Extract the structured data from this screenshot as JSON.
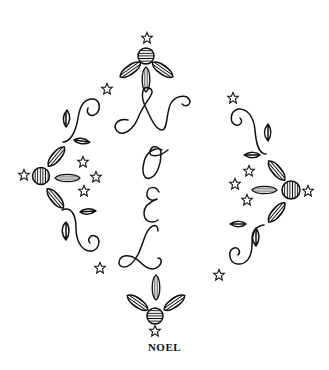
{
  "artwork": {
    "subject": "Embroidery pattern: the word NOEL in script letters arranged vertically, framed by four flower motifs, leafy swirls and stars",
    "script_letters": [
      "N",
      "O",
      "E",
      "L"
    ],
    "caption": "NOEL",
    "colors": {
      "line": "#111111",
      "background": "#ffffff"
    },
    "motifs": {
      "flowers": [
        "top",
        "left",
        "right",
        "bottom"
      ],
      "flower_parts": [
        "striped-center",
        "striped-petal-left",
        "striped-petal-middle",
        "striped-petal-right"
      ],
      "star_count": 12,
      "swirls": [
        "left-upper",
        "left-lower",
        "right-upper",
        "right-lower"
      ]
    }
  }
}
